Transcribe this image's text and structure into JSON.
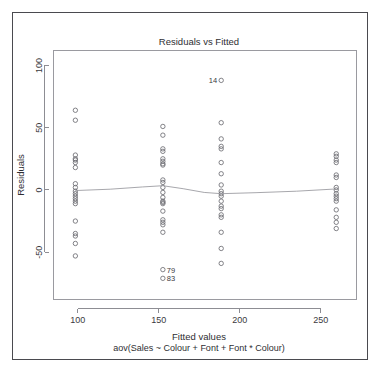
{
  "chart_data": {
    "type": "scatter",
    "title": "Residuals vs Fitted",
    "xlabel": "Fitted values",
    "sublabel": "aov(Sales ~ Colour + Font + Font * Colour)",
    "ylabel": "Residuals",
    "xlim": [
      85,
      272
    ],
    "ylim": [
      -88,
      112
    ],
    "xticks": [
      100,
      150,
      200,
      250
    ],
    "xtick_labels": [
      "100",
      "150",
      "200",
      "250"
    ],
    "yticks": [
      -50,
      0,
      50,
      100
    ],
    "ytick_labels": [
      "-50",
      "0",
      "50",
      "100"
    ],
    "grid": false,
    "legend": "none",
    "marker": "open-circle",
    "series": [
      {
        "name": "residuals",
        "points": [
          {
            "x": 98.5,
            "y": 64
          },
          {
            "x": 98.5,
            "y": 56
          },
          {
            "x": 98.5,
            "y": 28
          },
          {
            "x": 98.5,
            "y": 25
          },
          {
            "x": 98.5,
            "y": 24
          },
          {
            "x": 98.5,
            "y": 22
          },
          {
            "x": 98.5,
            "y": 18
          },
          {
            "x": 98.5,
            "y": 5
          },
          {
            "x": 98.5,
            "y": 2
          },
          {
            "x": 98.5,
            "y": -1
          },
          {
            "x": 98.5,
            "y": -3
          },
          {
            "x": 98.5,
            "y": -5
          },
          {
            "x": 98.5,
            "y": -7
          },
          {
            "x": 98.5,
            "y": -9
          },
          {
            "x": 98.5,
            "y": -11
          },
          {
            "x": 98.5,
            "y": -25
          },
          {
            "x": 98.5,
            "y": -35
          },
          {
            "x": 98.5,
            "y": -37
          },
          {
            "x": 98.5,
            "y": -43
          },
          {
            "x": 98.5,
            "y": -53
          },
          {
            "x": 152.5,
            "y": 51
          },
          {
            "x": 152.5,
            "y": 44
          },
          {
            "x": 152.5,
            "y": 33
          },
          {
            "x": 152.5,
            "y": 31
          },
          {
            "x": 152.5,
            "y": 25
          },
          {
            "x": 152.5,
            "y": 23
          },
          {
            "x": 152.5,
            "y": 21
          },
          {
            "x": 152.5,
            "y": 20
          },
          {
            "x": 152.5,
            "y": 8
          },
          {
            "x": 152.5,
            "y": 6
          },
          {
            "x": 152.5,
            "y": 2
          },
          {
            "x": 152.5,
            "y": -2
          },
          {
            "x": 152.5,
            "y": -6
          },
          {
            "x": 152.5,
            "y": -9
          },
          {
            "x": 152.5,
            "y": -10
          },
          {
            "x": 152.5,
            "y": -11
          },
          {
            "x": 152.5,
            "y": -17
          },
          {
            "x": 152.5,
            "y": -24
          },
          {
            "x": 152.5,
            "y": -26
          },
          {
            "x": 152.5,
            "y": -28
          },
          {
            "x": 152.5,
            "y": -34
          },
          {
            "x": 152.5,
            "y": -64
          },
          {
            "x": 152.5,
            "y": -71
          },
          {
            "x": 188.5,
            "y": 88
          },
          {
            "x": 188.5,
            "y": 54
          },
          {
            "x": 188.5,
            "y": 41
          },
          {
            "x": 188.5,
            "y": 35
          },
          {
            "x": 188.5,
            "y": 33
          },
          {
            "x": 188.5,
            "y": 22
          },
          {
            "x": 188.5,
            "y": 13
          },
          {
            "x": 188.5,
            "y": 4
          },
          {
            "x": 188.5,
            "y": -1
          },
          {
            "x": 188.5,
            "y": -3
          },
          {
            "x": 188.5,
            "y": -5
          },
          {
            "x": 188.5,
            "y": -9
          },
          {
            "x": 188.5,
            "y": -13
          },
          {
            "x": 188.5,
            "y": -15
          },
          {
            "x": 188.5,
            "y": -20
          },
          {
            "x": 188.5,
            "y": -22
          },
          {
            "x": 188.5,
            "y": -34
          },
          {
            "x": 188.5,
            "y": -47
          },
          {
            "x": 188.5,
            "y": -59
          },
          {
            "x": 259.5,
            "y": 29
          },
          {
            "x": 259.5,
            "y": 27
          },
          {
            "x": 259.5,
            "y": 24
          },
          {
            "x": 259.5,
            "y": 22
          },
          {
            "x": 259.5,
            "y": 12
          },
          {
            "x": 259.5,
            "y": 10
          },
          {
            "x": 259.5,
            "y": 2
          },
          {
            "x": 259.5,
            "y": 0
          },
          {
            "x": 259.5,
            "y": -3
          },
          {
            "x": 259.5,
            "y": -5
          },
          {
            "x": 259.5,
            "y": -7
          },
          {
            "x": 259.5,
            "y": -9
          },
          {
            "x": 259.5,
            "y": -16
          },
          {
            "x": 259.5,
            "y": -22
          },
          {
            "x": 259.5,
            "y": -26
          },
          {
            "x": 259.5,
            "y": -31
          }
        ]
      }
    ],
    "trend": {
      "name": "lowess",
      "points": [
        {
          "x": 98.5,
          "y": -0.5
        },
        {
          "x": 120.0,
          "y": 0.6
        },
        {
          "x": 140.0,
          "y": 2.4
        },
        {
          "x": 152.5,
          "y": 3.4
        },
        {
          "x": 165.0,
          "y": 1.0
        },
        {
          "x": 178.0,
          "y": -2.0
        },
        {
          "x": 188.5,
          "y": -3.0
        },
        {
          "x": 210.0,
          "y": -2.2
        },
        {
          "x": 235.0,
          "y": -1.0
        },
        {
          "x": 259.5,
          "y": 0.8
        }
      ]
    },
    "annotations": [
      {
        "label": "14",
        "x": 188.5,
        "y": 88,
        "anchor": "right"
      },
      {
        "label": "79",
        "x": 152.5,
        "y": -64,
        "anchor": "left"
      },
      {
        "label": "83",
        "x": 152.5,
        "y": -71,
        "anchor": "left"
      }
    ]
  },
  "colors": {
    "marker_stroke": "#6d6d73",
    "trend_stroke": "#9d9da3",
    "axis": "#8d8d93",
    "text": "#2e2e32",
    "frame": "#4a4a4f",
    "background": "#ffffff"
  }
}
